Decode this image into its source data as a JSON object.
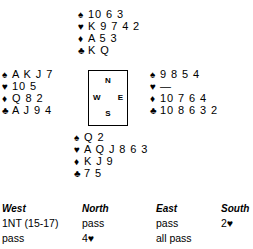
{
  "suits": {
    "spade": "♠",
    "heart": "♥",
    "diamond": "♦",
    "club": "♣"
  },
  "hands": {
    "north": {
      "label": "North",
      "spades": "10 6 3",
      "hearts": "K 9 7 4 2",
      "diamonds": "A 5 3",
      "clubs": "K Q"
    },
    "west": {
      "label": "West",
      "spades": "A K J 7",
      "hearts": "10 5",
      "diamonds": "Q 8 2",
      "clubs": "A J 9 4"
    },
    "east": {
      "label": "East",
      "spades": "9 8 5 4",
      "hearts": "—",
      "diamonds": "10 7 6 4",
      "clubs": "10 8 6 3 2"
    },
    "south": {
      "label": "South",
      "spades": "Q 2",
      "hearts": "A Q J 8 6 3",
      "diamonds": "K J 9",
      "clubs": "7 5"
    }
  },
  "compass": {
    "north": "N",
    "west": "W",
    "east": "E",
    "south": "S"
  },
  "auction": {
    "headers": [
      "West",
      "North",
      "East",
      "South"
    ],
    "rows": [
      [
        "1NT (15-17)",
        "pass",
        "pass",
        "2♥"
      ],
      [
        "pass",
        "4♥",
        "all pass",
        ""
      ]
    ]
  },
  "colors": {
    "ink": "#000000",
    "background": "#ffffff"
  }
}
